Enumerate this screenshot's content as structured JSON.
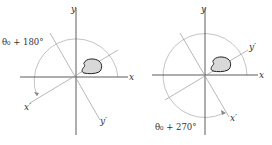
{
  "panels": [
    {
      "id": "left",
      "origin": [
        76,
        77
      ],
      "axis_labels": {
        "x": "x",
        "y": "y",
        "x_prime": "x′",
        "y_prime": "y′"
      },
      "angle_label": "θ₀ + 180°",
      "rotation_degrees": 180
    },
    {
      "id": "right",
      "origin": [
        205,
        75
      ],
      "axis_labels": {
        "x": "x",
        "y": "y",
        "x_prime": "x′",
        "y_prime": "y′"
      },
      "angle_label": "θ₀ + 270°",
      "rotation_degrees": 270
    }
  ],
  "colors": {
    "axis": "#333333",
    "rotated_axis": "#888888",
    "arc": "#aaaaaa",
    "blob_fill": "#d8d8d8",
    "blob_stroke": "#222222"
  }
}
